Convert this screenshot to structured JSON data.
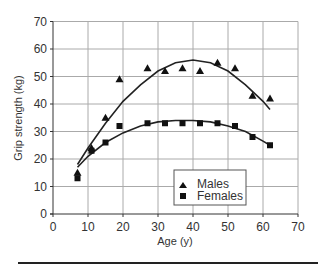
{
  "chart_data": {
    "type": "scatter",
    "title": "",
    "xlabel": "Age (y)",
    "ylabel": "Grip strength (kg)",
    "xlim": [
      0,
      70
    ],
    "ylim": [
      0,
      70
    ],
    "xticks": [
      0,
      10,
      20,
      30,
      40,
      50,
      60,
      70
    ],
    "yticks": [
      0,
      10,
      20,
      30,
      40,
      50,
      60,
      70
    ],
    "grid": true,
    "legend_position": "lower center",
    "series": [
      {
        "name": "Males",
        "marker": "triangle",
        "points": [
          [
            7,
            15
          ],
          [
            11,
            24
          ],
          [
            15,
            35
          ],
          [
            19,
            49
          ],
          [
            27,
            53
          ],
          [
            32,
            52
          ],
          [
            37,
            53
          ],
          [
            42,
            52
          ],
          [
            47,
            55
          ],
          [
            52,
            53
          ],
          [
            57,
            43
          ],
          [
            62,
            42
          ]
        ],
        "fit_curve": [
          [
            7,
            18
          ],
          [
            10,
            24
          ],
          [
            15,
            33
          ],
          [
            20,
            41
          ],
          [
            25,
            47
          ],
          [
            30,
            52
          ],
          [
            35,
            55
          ],
          [
            40,
            56
          ],
          [
            45,
            55
          ],
          [
            50,
            52
          ],
          [
            55,
            47
          ],
          [
            60,
            41
          ],
          [
            62,
            38
          ]
        ]
      },
      {
        "name": "Females",
        "marker": "square",
        "points": [
          [
            7,
            13
          ],
          [
            11,
            23
          ],
          [
            15,
            26
          ],
          [
            19,
            32
          ],
          [
            27,
            33
          ],
          [
            32,
            33
          ],
          [
            37,
            33
          ],
          [
            42,
            33
          ],
          [
            47,
            33
          ],
          [
            52,
            32
          ],
          [
            57,
            28
          ],
          [
            62,
            25
          ]
        ],
        "fit_curve": [
          [
            7,
            17
          ],
          [
            10,
            21
          ],
          [
            15,
            26
          ],
          [
            20,
            29.5
          ],
          [
            25,
            32
          ],
          [
            30,
            33.5
          ],
          [
            35,
            34
          ],
          [
            40,
            34
          ],
          [
            45,
            33.5
          ],
          [
            50,
            32
          ],
          [
            55,
            30
          ],
          [
            60,
            26.5
          ],
          [
            62,
            25
          ]
        ]
      }
    ]
  }
}
